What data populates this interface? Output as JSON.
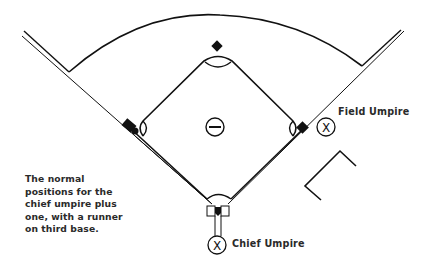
{
  "diagram": {
    "type": "baseball umpire positioning diagram",
    "caption_lines": [
      "The normal",
      "positions for the",
      "chief umpire plus",
      "one, with a runner",
      "on third base."
    ],
    "labels": {
      "field_umpire": "Field Umpire",
      "chief_umpire": "Chief Umpire"
    },
    "markers": {
      "umpire_symbol": "X",
      "pitcher_symbol": "⊖"
    },
    "elements": [
      "outfield-arc",
      "left-foul-line",
      "right-foul-line",
      "infield-diamond",
      "first-base",
      "second-base",
      "third-base-runner",
      "home-plate",
      "pitchers-mound",
      "field-umpire-position",
      "chief-umpire-position",
      "movement-chevron"
    ],
    "colors": {
      "line": "#111111",
      "text": "#2a2a2a",
      "background": "#ffffff"
    }
  }
}
